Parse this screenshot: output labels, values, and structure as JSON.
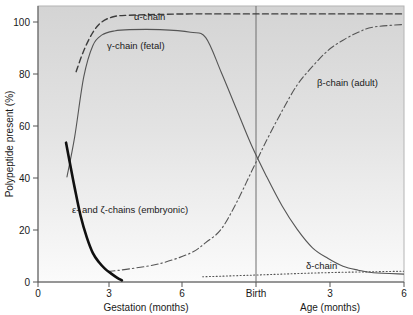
{
  "chart_data": {
    "type": "line",
    "title": "",
    "xlabel": "Gestation (months) / Age (months)",
    "ylabel": "Polypeptide present (%)",
    "ylim": [
      0,
      105
    ],
    "xlim": [
      0,
      12
    ],
    "grid": false,
    "legend_position": "inline-annotations",
    "background": "vertical gradient light grey to white",
    "x_axis": {
      "left_section_label": "Gestation (months)",
      "right_section_label": "Age (months)",
      "divider_label": "Birth",
      "divider_x": 6,
      "ticks": [
        {
          "value": 0,
          "label": "0"
        },
        {
          "value": 3,
          "label": "3"
        },
        {
          "value": 6,
          "label": "6"
        },
        {
          "value": 6,
          "label": "Birth"
        },
        {
          "value": 9,
          "label": "3"
        },
        {
          "value": 12,
          "label": "6"
        }
      ]
    },
    "y_axis": {
      "label": "Polypeptide present (%)",
      "ticks": [
        {
          "value": 0,
          "label": "0"
        },
        {
          "value": 20,
          "label": "20"
        },
        {
          "value": 40,
          "label": "40"
        },
        {
          "value": 60,
          "label": "60"
        },
        {
          "value": 80,
          "label": "80"
        },
        {
          "value": 100,
          "label": "100"
        }
      ]
    },
    "series": [
      {
        "name": "alpha-chain",
        "label": "α-chain",
        "style": "dashed",
        "color": "#3c3c3c",
        "width": 1.4,
        "label_position": {
          "x": 3.05,
          "y": 104
        },
        "x": [
          1.25,
          1.5,
          1.8,
          2.1,
          2.5,
          3.0,
          4.0,
          5.0,
          6.0,
          7.5,
          9.0,
          10.5,
          12.0
        ],
        "y": [
          80,
          88,
          95,
          99,
          101,
          101.5,
          101.8,
          102,
          102,
          102,
          102,
          102,
          102
        ]
      },
      {
        "name": "gamma-chain-fetal",
        "label": "γ-chain (fetal)",
        "style": "solid",
        "color": "#555555",
        "width": 1.1,
        "label_position": {
          "x": 2.6,
          "y": 95
        },
        "x": [
          0.95,
          1.2,
          1.5,
          1.8,
          2.1,
          2.5,
          3.0,
          4.0,
          5.0,
          5.5,
          6.0,
          6.5,
          7.0,
          7.5,
          8.0,
          8.5,
          9.0,
          9.5,
          10.0,
          10.5,
          11.0,
          12.0
        ],
        "y": [
          40,
          55,
          78,
          90,
          94,
          95.5,
          96,
          96,
          95,
          93,
          80,
          66,
          52,
          40,
          29,
          20,
          13,
          9,
          6,
          4.5,
          3.5,
          3
        ]
      },
      {
        "name": "beta-chain-adult",
        "label": "β-chain (adult)",
        "style": "dashdot",
        "color": "#555555",
        "width": 1.1,
        "label_position": {
          "x": 9.6,
          "y": 81
        },
        "x": [
          2.3,
          3.0,
          4.0,
          5.0,
          5.5,
          6.0,
          6.5,
          7.0,
          7.5,
          8.0,
          8.5,
          9.0,
          9.5,
          10.0,
          10.5,
          11.0,
          12.0
        ],
        "y": [
          4,
          5,
          7,
          11,
          15,
          20,
          30,
          42,
          54,
          65,
          75,
          82,
          88,
          92,
          95,
          97,
          98
        ]
      },
      {
        "name": "delta-chain",
        "label": "δ-chain",
        "style": "dotted",
        "color": "#555555",
        "width": 1.1,
        "label_position": {
          "x": 9.0,
          "y": 8
        },
        "x": [
          5.4,
          6.0,
          7.0,
          8.0,
          9.0,
          10.0,
          11.0,
          12.0
        ],
        "y": [
          2,
          2.2,
          2.6,
          3.0,
          3.4,
          3.7,
          3.9,
          4.1
        ]
      },
      {
        "name": "epsilon-zeta-chains-embryonic",
        "label": "ε- and ζ-chains (embryonic)",
        "style": "solid-thick",
        "color": "#101010",
        "width": 2.6,
        "label_position": {
          "x": 1.55,
          "y": 30
        },
        "x": [
          0.92,
          1.05,
          1.2,
          1.4,
          1.6,
          1.8,
          2.0,
          2.2,
          2.4,
          2.6,
          2.75
        ],
        "y": [
          53,
          45,
          36,
          25,
          17,
          11,
          7.5,
          5,
          3.2,
          1.6,
          0.6
        ]
      }
    ]
  },
  "axis_titles": {
    "y": "Polypeptide present (%)",
    "x_left": "Gestation (months)",
    "x_right": "Age (months)"
  },
  "tick_labels": {
    "y": [
      "100",
      "80",
      "60",
      "40",
      "20",
      "0"
    ],
    "x_left": [
      "0",
      "3",
      "6"
    ],
    "x_birth": "Birth",
    "x_right": [
      "3",
      "6"
    ]
  },
  "series_labels": {
    "alpha": "α-chain",
    "gamma": "γ-chain (fetal)",
    "beta": "β-chain (adult)",
    "delta": "δ-chain",
    "epsilon_zeta": "ε- and ζ-chains (embryonic)"
  },
  "colors": {
    "plot_bg_top": "#d5d5d5",
    "plot_bg_bottom": "#fbfbfb",
    "axis": "#555555",
    "text": "#1a1a1a",
    "thick_curve": "#101010",
    "thin_curve": "#555555"
  }
}
